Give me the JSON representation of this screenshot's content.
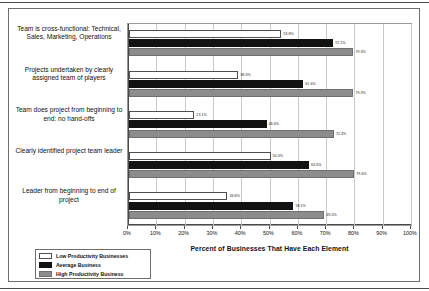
{
  "chart_data": {
    "type": "bar",
    "orientation": "horizontal",
    "title": "",
    "xlabel": "Percent of Businesses That Have Each Element",
    "ylabel": "",
    "xlim": [
      0,
      100
    ],
    "xtick_labels": [
      "0%",
      "10%",
      "20%",
      "30%",
      "40%",
      "50%",
      "60%",
      "70%",
      "80%",
      "90%",
      "100%"
    ],
    "xtick_values": [
      0,
      10,
      20,
      30,
      40,
      50,
      60,
      70,
      80,
      90,
      100
    ],
    "grid": true,
    "legend_position": "bottom-left",
    "categories": [
      "Team is cross-functional: Technical, Sales, Marketing, Operations",
      "Projects undertaken by clearly assigned team of players",
      "Team does project from beginning to end: no hand-offs",
      "Clearly identified project team leader",
      "Leader from beginning to end of project"
    ],
    "series": [
      {
        "name": "Low Productivity Businesses",
        "color": "#ffffff",
        "values": [
          53.8,
          38.6,
          23.1,
          50.0,
          34.8
        ],
        "labels": [
          "53.8%",
          "38.6%",
          "23.1%",
          "50.0%",
          "34.8%"
        ]
      },
      {
        "name": "Average Business",
        "color": "#121212",
        "values": [
          72.1,
          61.6,
          48.6,
          63.6,
          58.1
        ],
        "labels": [
          "72.1%",
          "61.6%",
          "48.6%",
          "63.6%",
          "58.1%"
        ]
      },
      {
        "name": "High Productivity Business",
        "color": "#8c8c8c",
        "values": [
          79.3,
          79.3,
          72.4,
          79.6,
          69.0
        ],
        "labels": [
          "79.3%",
          "79.3%",
          "72.4%",
          "79.6%",
          "69.0%"
        ]
      }
    ]
  }
}
